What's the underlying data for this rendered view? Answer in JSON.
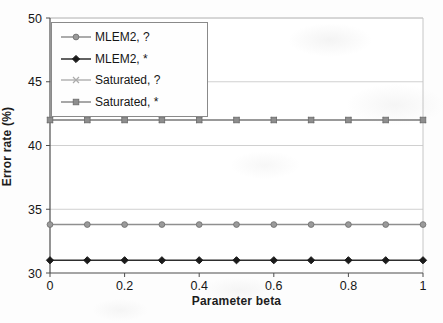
{
  "chart_data": {
    "type": "line",
    "title": "",
    "xlabel": "Parameter beta",
    "ylabel": "Error rate (%)",
    "xlim": [
      0,
      1
    ],
    "ylim": [
      30,
      50
    ],
    "xticks": [
      0,
      0.2,
      0.4,
      0.6,
      0.8,
      1
    ],
    "xtick_labels": [
      "0",
      "0.2",
      "0.4",
      "0.6",
      "0.8",
      "1"
    ],
    "yticks": [
      30,
      35,
      40,
      45,
      50
    ],
    "ytick_labels": [
      "30",
      "35",
      "40",
      "45",
      "50"
    ],
    "grid": "horizontal-gridlines-on",
    "legend_position": "top-left-inside-boxed",
    "x": [
      0,
      0.1,
      0.2,
      0.3,
      0.4,
      0.5,
      0.6,
      0.7,
      0.8,
      0.9,
      1
    ],
    "series": [
      {
        "name": "MLEM2, ?",
        "marker": "circle",
        "marker_color": "#9a9a9a",
        "line_color": "#8f8f8f",
        "values": [
          33.8,
          33.8,
          33.8,
          33.8,
          33.8,
          33.8,
          33.8,
          33.8,
          33.8,
          33.8,
          33.8
        ]
      },
      {
        "name": "MLEM2, *",
        "marker": "diamond",
        "marker_color": "#1a1a1a",
        "line_color": "#2e2e2e",
        "values": [
          31,
          31,
          31,
          31,
          31,
          31,
          31,
          31,
          31,
          31,
          31
        ]
      },
      {
        "name": "Saturated, ?",
        "marker": "x",
        "marker_color": "#ababab",
        "line_color": "#b3b3b3",
        "values": [
          42,
          42,
          42,
          42,
          42,
          42,
          42,
          42,
          42,
          42,
          42
        ]
      },
      {
        "name": "Saturated, *",
        "marker": "square",
        "marker_color": "#8d8d8d",
        "line_color": "#8a8a8a",
        "values": [
          42,
          42,
          42,
          42,
          42,
          42,
          42,
          42,
          42,
          42,
          42
        ]
      }
    ]
  },
  "style_colors": {
    "axis": "#4d4d4d",
    "border_light": "#c6c6c6",
    "gridline": "#d0d0d0",
    "tick_text": "#161616",
    "plot_background": "#ffffff"
  }
}
